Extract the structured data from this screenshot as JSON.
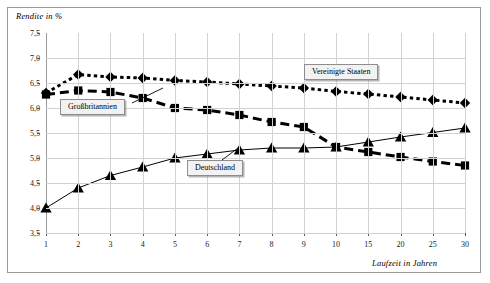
{
  "chart_data": {
    "type": "line",
    "title": "",
    "xlabel": "Laufzeit in Jahren",
    "ylabel": "Rendite in %",
    "categories": [
      "1",
      "2",
      "3",
      "4",
      "5",
      "6",
      "7",
      "8",
      "9",
      "10",
      "15",
      "20",
      "25",
      "30"
    ],
    "ytick_labels": [
      "7,5",
      "7,0",
      "6,5",
      "6,0",
      "5,5",
      "5,0",
      "4,5",
      "4,0",
      "3,5"
    ],
    "ylim": [
      3.5,
      7.5
    ],
    "ytick_step": 0.5,
    "grid": "both",
    "legend_position": "inline-callouts",
    "series": [
      {
        "name": "Vereinigte Staaten",
        "marker": "diamond",
        "line_style": "dotted",
        "color": "#000000",
        "values": [
          6.3,
          6.67,
          6.62,
          6.6,
          6.55,
          6.52,
          6.48,
          6.44,
          6.4,
          6.33,
          6.28,
          6.22,
          6.16,
          6.1
        ]
      },
      {
        "name": "Großbritannien",
        "marker": "square",
        "line_style": "dashed",
        "color": "#000000",
        "values": [
          6.27,
          6.35,
          6.32,
          6.2,
          6.0,
          5.96,
          5.86,
          5.72,
          5.62,
          5.22,
          5.12,
          5.02,
          4.93,
          4.85
        ]
      },
      {
        "name": "Deutschland",
        "marker": "triangle",
        "line_style": "solid",
        "color": "#000000",
        "values": [
          4.0,
          4.4,
          4.65,
          4.82,
          5.0,
          5.08,
          5.16,
          5.2,
          5.2,
          5.22,
          5.32,
          5.42,
          5.51,
          5.6
        ]
      }
    ],
    "annotations": [
      {
        "label": "Vereinigte Staaten",
        "anchor_index": 9
      },
      {
        "label": "Großbritannien",
        "anchor_index": 1
      },
      {
        "label": "Deutschland",
        "anchor_index": 5
      }
    ]
  }
}
